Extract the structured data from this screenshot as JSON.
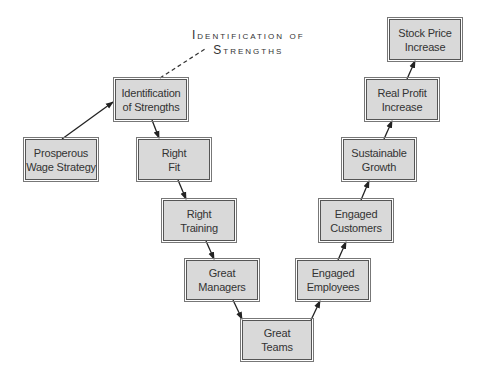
{
  "diagram": {
    "callout": {
      "line1": "Identification of",
      "line2": "Strengths"
    },
    "nodes": [
      {
        "id": "prosperous-wage-strategy",
        "line1": "Prosperous",
        "line2": "Wage Strategy"
      },
      {
        "id": "identification-of-strengths",
        "line1": "Identification",
        "line2": "of Strengths"
      },
      {
        "id": "right-fit",
        "line1": "Right",
        "line2": "Fit"
      },
      {
        "id": "right-training",
        "line1": "Right",
        "line2": "Training"
      },
      {
        "id": "great-managers",
        "line1": "Great",
        "line2": "Managers"
      },
      {
        "id": "great-teams",
        "line1": "Great",
        "line2": "Teams"
      },
      {
        "id": "engaged-employees",
        "line1": "Engaged",
        "line2": "Employees"
      },
      {
        "id": "engaged-customers",
        "line1": "Engaged",
        "line2": "Customers"
      },
      {
        "id": "sustainable-growth",
        "line1": "Sustainable",
        "line2": "Growth"
      },
      {
        "id": "real-profit-increase",
        "line1": "Real Profit",
        "line2": "Increase"
      },
      {
        "id": "stock-price-increase",
        "line1": "Stock Price",
        "line2": "Increase"
      }
    ],
    "edges": [
      [
        "prosperous-wage-strategy",
        "identification-of-strengths"
      ],
      [
        "identification-of-strengths",
        "right-fit"
      ],
      [
        "right-fit",
        "right-training"
      ],
      [
        "right-training",
        "great-managers"
      ],
      [
        "great-managers",
        "great-teams"
      ],
      [
        "great-teams",
        "engaged-employees"
      ],
      [
        "engaged-employees",
        "engaged-customers"
      ],
      [
        "engaged-customers",
        "sustainable-growth"
      ],
      [
        "sustainable-growth",
        "real-profit-increase"
      ],
      [
        "real-profit-increase",
        "stock-price-increase"
      ]
    ],
    "colors": {
      "box_fill": "#d9d9d9",
      "box_border": "#555555",
      "line": "#222222",
      "text": "#333333"
    }
  }
}
